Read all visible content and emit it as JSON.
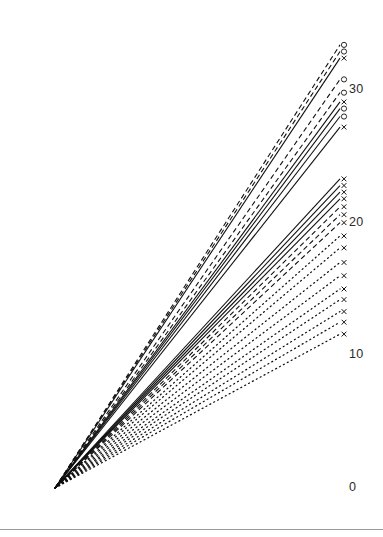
{
  "chart_data": {
    "type": "line",
    "title": "",
    "subtitle": "",
    "xlabel": "",
    "ylabel": "",
    "grid": false,
    "legend": "none",
    "xlim": [
      0,
      1
    ],
    "ylim": [
      0,
      34
    ],
    "y_ticks": [
      0,
      10,
      20,
      30
    ],
    "y_tick_labels": [
      "0",
      "10",
      "20",
      "30"
    ],
    "tick_side": "right",
    "origin_note": "all series start at (0,0) and fan out linearly",
    "x": [
      0,
      1
    ],
    "series": [
      {
        "name": "s01",
        "values": [
          0,
          33.4
        ],
        "style": "dashed",
        "marker": "circle"
      },
      {
        "name": "s02",
        "values": [
          0,
          32.9
        ],
        "style": "dashed",
        "marker": "circle"
      },
      {
        "name": "s03",
        "values": [
          0,
          32.4
        ],
        "style": "solid",
        "marker": "x"
      },
      {
        "name": "s04",
        "values": [
          0,
          30.8
        ],
        "style": "dashed",
        "marker": "circle"
      },
      {
        "name": "s05",
        "values": [
          0,
          29.8
        ],
        "style": "dashed",
        "marker": "circle"
      },
      {
        "name": "s06",
        "values": [
          0,
          29.1
        ],
        "style": "solid",
        "marker": "x"
      },
      {
        "name": "s07",
        "values": [
          0,
          28.6
        ],
        "style": "solid",
        "marker": "circle"
      },
      {
        "name": "s08",
        "values": [
          0,
          28.0
        ],
        "style": "solid",
        "marker": "circle"
      },
      {
        "name": "s09",
        "values": [
          0,
          27.2
        ],
        "style": "solid",
        "marker": "x"
      },
      {
        "name": "s10",
        "values": [
          0,
          23.3
        ],
        "style": "solid",
        "marker": "x"
      },
      {
        "name": "s11",
        "values": [
          0,
          22.8
        ],
        "style": "solid",
        "marker": "x"
      },
      {
        "name": "s12",
        "values": [
          0,
          22.3
        ],
        "style": "solid",
        "marker": "x"
      },
      {
        "name": "s13",
        "values": [
          0,
          21.8
        ],
        "style": "solid",
        "marker": "x"
      },
      {
        "name": "s14",
        "values": [
          0,
          21.2
        ],
        "style": "dashed",
        "marker": "x"
      },
      {
        "name": "s15",
        "values": [
          0,
          20.6
        ],
        "style": "dashed",
        "marker": "x"
      },
      {
        "name": "s16",
        "values": [
          0,
          20.0
        ],
        "style": "dashed",
        "marker": "x"
      },
      {
        "name": "s17",
        "values": [
          0,
          19.0
        ],
        "style": "dotted",
        "marker": "x"
      },
      {
        "name": "s18",
        "values": [
          0,
          18.1
        ],
        "style": "dotted",
        "marker": "x"
      },
      {
        "name": "s19",
        "values": [
          0,
          17.0
        ],
        "style": "dotted",
        "marker": "x"
      },
      {
        "name": "s20",
        "values": [
          0,
          16.0
        ],
        "style": "dotted",
        "marker": "x"
      },
      {
        "name": "s21",
        "values": [
          0,
          15.0
        ],
        "style": "dotted",
        "marker": "x"
      },
      {
        "name": "s22",
        "values": [
          0,
          14.2
        ],
        "style": "dotted",
        "marker": "x"
      },
      {
        "name": "s23",
        "values": [
          0,
          13.3
        ],
        "style": "dotted",
        "marker": "x"
      },
      {
        "name": "s24",
        "values": [
          0,
          12.5
        ],
        "style": "dotted",
        "marker": "x"
      },
      {
        "name": "s25",
        "values": [
          0,
          11.6
        ],
        "style": "dotted",
        "marker": "x"
      }
    ],
    "colors": {
      "line": "#111111",
      "marker": "#111111",
      "tick_label": "#2b2b2b",
      "rule": "#9a9a9a",
      "background": "#ffffff"
    }
  },
  "footer": {
    "rule_visible": true
  }
}
